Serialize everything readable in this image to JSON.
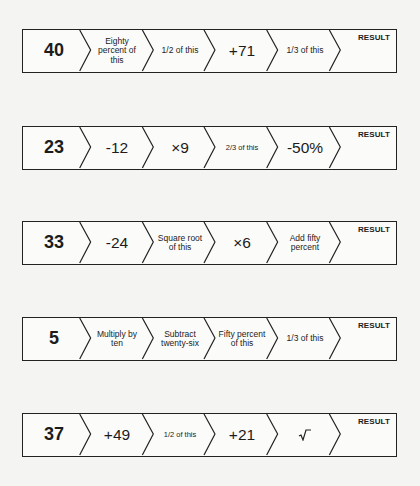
{
  "chains": [
    {
      "start": "40",
      "steps": [
        {
          "label": "Eighty percent of this",
          "size": "small"
        },
        {
          "label": "1/2 of this",
          "size": "small"
        },
        {
          "label": "+71",
          "size": "big"
        },
        {
          "label": "1/3 of this",
          "size": "small"
        }
      ],
      "result_label": "RESULT",
      "result_value": ""
    },
    {
      "start": "23",
      "steps": [
        {
          "label": "-12",
          "size": "big"
        },
        {
          "label": "×9",
          "size": "big"
        },
        {
          "label": "2/3 of this",
          "size": "tiny"
        },
        {
          "label": "-50%",
          "size": "big"
        }
      ],
      "result_label": "RESULT",
      "result_value": ""
    },
    {
      "start": "33",
      "steps": [
        {
          "label": "-24",
          "size": "big"
        },
        {
          "label": "Square root of this",
          "size": "small"
        },
        {
          "label": "×6",
          "size": "big"
        },
        {
          "label": "Add fifty percent",
          "size": "small"
        }
      ],
      "result_label": "RESULT",
      "result_value": ""
    },
    {
      "start": "5",
      "steps": [
        {
          "label": "Multiply by ten",
          "size": "small"
        },
        {
          "label": "Subtract twenty-six",
          "size": "small"
        },
        {
          "label": "Fifty percent of this",
          "size": "small"
        },
        {
          "label": "1/3 of this",
          "size": "small"
        }
      ],
      "result_label": "RESULT",
      "result_value": ""
    },
    {
      "start": "37",
      "steps": [
        {
          "label": "+49",
          "size": "big"
        },
        {
          "label": "1/2 of this",
          "size": "tiny"
        },
        {
          "label": "+21",
          "size": "big"
        },
        {
          "label": "√",
          "size": "big",
          "icon": "square-root-icon"
        }
      ],
      "result_label": "RESULT",
      "result_value": ""
    }
  ],
  "colors": {
    "background": "#f4f4f2",
    "box_fill": "#fbfbfa",
    "border": "#222222",
    "text": "#1c1c1c"
  }
}
